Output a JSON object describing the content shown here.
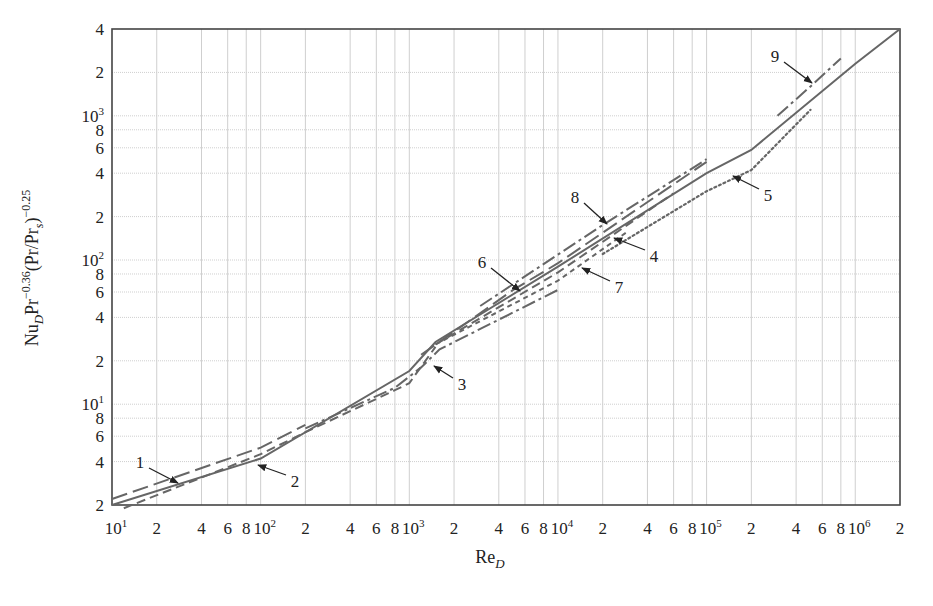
{
  "chart_data": {
    "type": "line",
    "title": "",
    "xlabel": "Re_D",
    "ylabel": "Nu_D Pr^-0.36 (Pr/Pr_s)^-0.25",
    "xscale": "log",
    "yscale": "log",
    "xlim": [
      10,
      2000000
    ],
    "ylim": [
      2,
      4000
    ],
    "grid": true,
    "legend": "none (curves labeled 1–9 with arrows)",
    "x_tick_labels": [
      {
        "v": 10,
        "text": "10",
        "sup": "1"
      },
      {
        "v": 20,
        "text": "2"
      },
      {
        "v": 40,
        "text": "4"
      },
      {
        "v": 60,
        "text": "6"
      },
      {
        "v": 80,
        "text": "8"
      },
      {
        "v": 100,
        "text": "10",
        "sup": "2"
      },
      {
        "v": 200,
        "text": "2"
      },
      {
        "v": 400,
        "text": "4"
      },
      {
        "v": 600,
        "text": "6"
      },
      {
        "v": 800,
        "text": "8"
      },
      {
        "v": 1000,
        "text": "10",
        "sup": "3"
      },
      {
        "v": 2000,
        "text": "2"
      },
      {
        "v": 4000,
        "text": "4"
      },
      {
        "v": 6000,
        "text": "6"
      },
      {
        "v": 8000,
        "text": "8"
      },
      {
        "v": 10000,
        "text": "10",
        "sup": "4"
      },
      {
        "v": 20000,
        "text": "2"
      },
      {
        "v": 40000,
        "text": "4"
      },
      {
        "v": 60000,
        "text": "6"
      },
      {
        "v": 80000,
        "text": "8"
      },
      {
        "v": 100000,
        "text": "10",
        "sup": "5"
      },
      {
        "v": 200000,
        "text": "2"
      },
      {
        "v": 400000,
        "text": "4"
      },
      {
        "v": 600000,
        "text": "6"
      },
      {
        "v": 800000,
        "text": "8"
      },
      {
        "v": 1000000,
        "text": "10",
        "sup": "6"
      },
      {
        "v": 2000000,
        "text": "2"
      }
    ],
    "y_tick_labels": [
      {
        "v": 2,
        "text": "2"
      },
      {
        "v": 4,
        "text": "4"
      },
      {
        "v": 6,
        "text": "6"
      },
      {
        "v": 8,
        "text": "8"
      },
      {
        "v": 10,
        "text": "10",
        "sup": "1"
      },
      {
        "v": 20,
        "text": "2"
      },
      {
        "v": 40,
        "text": "4"
      },
      {
        "v": 60,
        "text": "6"
      },
      {
        "v": 80,
        "text": "8"
      },
      {
        "v": 100,
        "text": "10",
        "sup": "2"
      },
      {
        "v": 200,
        "text": "2"
      },
      {
        "v": 400,
        "text": "4"
      },
      {
        "v": 600,
        "text": "6"
      },
      {
        "v": 800,
        "text": "8"
      },
      {
        "v": 1000,
        "text": "10",
        "sup": "3"
      },
      {
        "v": 2000,
        "text": "2"
      },
      {
        "v": 4000,
        "text": "4"
      }
    ],
    "series": [
      {
        "name": "main (solid)",
        "style": "solid",
        "x": [
          10,
          100,
          1000,
          1500,
          10000,
          100000,
          200000,
          1000000,
          2000000
        ],
        "y": [
          2.0,
          4.2,
          17,
          27,
          90,
          400,
          580,
          2300,
          4000
        ]
      },
      {
        "name": "1",
        "style": "longdash",
        "x": [
          10,
          100,
          200
        ],
        "y": [
          2.2,
          5.0,
          7.2
        ]
      },
      {
        "name": "2",
        "style": "dash",
        "x": [
          12,
          100,
          200,
          800,
          1000,
          1500
        ],
        "y": [
          1.9,
          4.5,
          6.4,
          12.5,
          14,
          25
        ]
      },
      {
        "name": "3",
        "style": "dashdot",
        "x": [
          200,
          800,
          1200,
          1600,
          10000
        ],
        "y": [
          6.8,
          13,
          18,
          24,
          62
        ]
      },
      {
        "name": "4",
        "style": "dash",
        "x": [
          1500,
          10000,
          60000
        ],
        "y": [
          26,
          82,
          290
        ]
      },
      {
        "name": "5",
        "style": "dotted",
        "x": [
          20000,
          100000,
          200000,
          500000
        ],
        "y": [
          110,
          300,
          420,
          1100
        ]
      },
      {
        "name": "6",
        "style": "longdash",
        "x": [
          1200,
          5000,
          10000,
          100000
        ],
        "y": [
          22,
          62,
          95,
          480
        ]
      },
      {
        "name": "7",
        "style": "shortdash",
        "x": [
          1500,
          10000,
          30000
        ],
        "y": [
          26,
          72,
          160
        ]
      },
      {
        "name": "8",
        "style": "dashdot",
        "x": [
          3000,
          20000,
          100000
        ],
        "y": [
          48,
          175,
          500
        ]
      },
      {
        "name": "9",
        "style": "dashdot",
        "x": [
          300000,
          500000,
          800000
        ],
        "y": [
          1000,
          1600,
          2500
        ]
      }
    ],
    "annotations": [
      {
        "label": "1",
        "text_x_px": 140,
        "text_y_px": 468,
        "arrow_to_px": [
          178,
          483
        ]
      },
      {
        "label": "2",
        "text_x_px": 295,
        "text_y_px": 487,
        "arrow_to_px": [
          258,
          465
        ]
      },
      {
        "label": "3",
        "text_x_px": 462,
        "text_y_px": 390,
        "arrow_to_px": [
          434,
          366
        ]
      },
      {
        "label": "4",
        "text_x_px": 654,
        "text_y_px": 262,
        "arrow_to_px": [
          614,
          238
        ]
      },
      {
        "label": "5",
        "text_x_px": 768,
        "text_y_px": 201,
        "arrow_to_px": [
          733,
          176
        ]
      },
      {
        "label": "6",
        "text_x_px": 482,
        "text_y_px": 268,
        "arrow_to_px": [
          520,
          291
        ]
      },
      {
        "label": "7",
        "text_x_px": 619,
        "text_y_px": 293,
        "arrow_to_px": [
          582,
          268
        ]
      },
      {
        "label": "8",
        "text_x_px": 575,
        "text_y_px": 203,
        "arrow_to_px": [
          607,
          224
        ]
      },
      {
        "label": "9",
        "text_x_px": 775,
        "text_y_px": 62,
        "arrow_to_px": [
          812,
          83
        ]
      }
    ]
  },
  "axes": {
    "x_label_main": "Re",
    "x_label_sub": "D",
    "y_label_parts": {
      "nu": "Nu",
      "nu_sub": "D",
      "pr": "Pr",
      "pr_exp": "−0.36",
      "paren": "(Pr/Pr",
      "paren_sub": "s",
      "paren_close": ")",
      "outer_exp": "−0.25"
    }
  }
}
